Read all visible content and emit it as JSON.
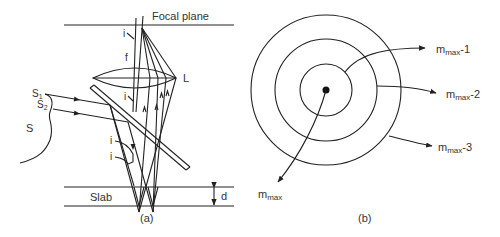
{
  "figure": {
    "panel_a": {
      "caption": "(a)",
      "labels": {
        "focal_plane": "Focal plane",
        "lens": "L",
        "focal_length": "f",
        "angle_top": "i",
        "angle_mid": "i",
        "angle_low1": "i",
        "angle_low2": "i",
        "source": "S",
        "source_point1": "S",
        "source_point1_sub": "1",
        "source_point2": "S",
        "source_point2_sub": "2",
        "slab": "Slab",
        "thickness": "d"
      }
    },
    "panel_b": {
      "caption": "(b)",
      "rings": [
        {
          "label": "m",
          "sub": "max",
          "suffix": "-1"
        },
        {
          "label": "m",
          "sub": "max",
          "suffix": "-2"
        },
        {
          "label": "m",
          "sub": "max",
          "suffix": "-3"
        }
      ],
      "center": {
        "label": "m",
        "sub": "max"
      }
    },
    "colors": {
      "line": "#222222",
      "text": "#333333",
      "background": "#ffffff"
    }
  }
}
